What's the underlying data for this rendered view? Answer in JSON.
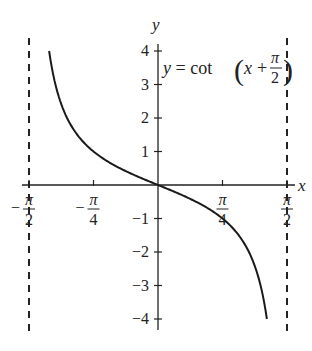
{
  "chart_data": {
    "type": "line",
    "title": "",
    "equation": {
      "prefix": "y = cot",
      "var": "x",
      "plus": "+",
      "frac_num": "π",
      "frac_den": "2"
    },
    "xlabel": "x",
    "ylabel": "y",
    "xlim": [
      -1.5708,
      1.5708
    ],
    "ylim": [
      -4,
      4
    ],
    "x_ticks": [
      {
        "value": -1.5708,
        "num": "π",
        "den": "2",
        "sign": "−"
      },
      {
        "value": -0.7854,
        "num": "π",
        "den": "4",
        "sign": "−"
      },
      {
        "value": 0.7854,
        "num": "π",
        "den": "4",
        "sign": ""
      },
      {
        "value": 1.5708,
        "num": "π",
        "den": "2",
        "sign": ""
      }
    ],
    "y_ticks": [
      {
        "value": 4,
        "label": "4"
      },
      {
        "value": 3,
        "label": "3"
      },
      {
        "value": 2,
        "label": "2"
      },
      {
        "value": 1,
        "label": "1"
      },
      {
        "value": -1,
        "label": "−1"
      },
      {
        "value": -2,
        "label": "−2"
      },
      {
        "value": -3,
        "label": "−3"
      },
      {
        "value": -4,
        "label": "−4"
      }
    ],
    "asymptotes": [
      -1.5708,
      1.5708
    ],
    "series": [
      {
        "name": "y = cot(x + π/2)",
        "function": "-tan(x)",
        "x_range": [
          -1.3258,
          1.3258
        ],
        "points": [
          [
            -1.3258,
            4.0
          ],
          [
            -1.25,
            3.01
          ],
          [
            -1.1,
            1.96
          ],
          [
            -0.9,
            1.26
          ],
          [
            -0.7854,
            1.0
          ],
          [
            -0.6,
            0.68
          ],
          [
            -0.4,
            0.42
          ],
          [
            -0.2,
            0.2
          ],
          [
            0,
            0
          ],
          [
            0.2,
            -0.2
          ],
          [
            0.4,
            -0.42
          ],
          [
            0.6,
            -0.68
          ],
          [
            0.7854,
            -1.0
          ],
          [
            0.9,
            -1.26
          ],
          [
            1.1,
            -1.96
          ],
          [
            1.25,
            -3.01
          ],
          [
            1.3258,
            -4.0
          ]
        ]
      }
    ],
    "grid": false,
    "legend": "none"
  }
}
